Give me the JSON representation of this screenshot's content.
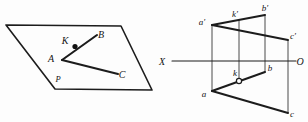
{
  "figure": {
    "background_color": "#fdfdfd",
    "ink_color": "#1c1c1c"
  },
  "left_diagram": {
    "name": "pictorial-plane-with-angle",
    "plane_label": "P",
    "points": [
      {
        "id": "A",
        "label": "A",
        "x": 62,
        "y": 60,
        "label_x": 51,
        "label_y": 62
      },
      {
        "id": "K",
        "label": "K",
        "x": 75,
        "y": 46,
        "label_x": 64,
        "label_y": 44
      },
      {
        "id": "B",
        "label": "B",
        "x": 97,
        "y": 35,
        "label_x": 99,
        "label_y": 38
      },
      {
        "id": "C",
        "label": "C",
        "x": 118,
        "y": 74,
        "label_x": 120,
        "label_y": 77
      }
    ],
    "plane_corners": [
      {
        "x": 6,
        "y": 25
      },
      {
        "x": 121,
        "y": 26
      },
      {
        "x": 152,
        "y": 90
      },
      {
        "x": 55,
        "y": 89
      }
    ],
    "segments": [
      {
        "from": "A",
        "to": "B",
        "through": "K"
      },
      {
        "from": "A",
        "to": "C"
      }
    ],
    "plane_label_pos": {
      "x": 58,
      "y": 81
    },
    "marked_point": "K"
  },
  "right_diagram": {
    "name": "orthographic-projection-epure",
    "axis": {
      "label_left": "X",
      "label_right": "O",
      "label_left_pos": {
        "x": 162,
        "y": 65
      },
      "label_right_pos": {
        "x": 298,
        "y": 65
      },
      "y": 61,
      "x_start": 172,
      "x_end": 296
    },
    "upper_points": [
      {
        "id": "a-prime",
        "label": "a′",
        "x": 212,
        "y": 25,
        "label_x": 201,
        "label_y": 24
      },
      {
        "id": "k-prime",
        "label": "k′",
        "x": 239,
        "y": 20,
        "label_x": 233,
        "label_y": 17
      },
      {
        "id": "b-prime",
        "label": "b′",
        "x": 265,
        "y": 15,
        "label_x": 262,
        "label_y": 13
      },
      {
        "id": "c-prime",
        "label": "c′",
        "x": 288,
        "y": 40,
        "label_x": 289,
        "label_y": 38
      }
    ],
    "lower_points": [
      {
        "id": "a",
        "label": "a",
        "x": 212,
        "y": 91,
        "label_x": 203,
        "label_y": 96
      },
      {
        "id": "k",
        "label": "k",
        "x": 239,
        "y": 79,
        "label_x": 234,
        "label_y": 74
      },
      {
        "id": "b",
        "label": "b",
        "x": 265,
        "y": 72,
        "label_x": 267,
        "label_y": 72
      },
      {
        "id": "c",
        "label": "c",
        "x": 288,
        "y": 113,
        "label_x": 289,
        "label_y": 115
      }
    ],
    "recall_lines": [
      {
        "id": "recall-a",
        "x": 212,
        "y_top": 25,
        "y_bottom": 91
      },
      {
        "id": "recall-k",
        "x": 239,
        "y_top": 20,
        "y_bottom": 79
      },
      {
        "id": "recall-b",
        "x": 265,
        "y_top": 15,
        "y_bottom": 72
      },
      {
        "id": "recall-c",
        "x": 288,
        "y_top": 40,
        "y_bottom": 113
      }
    ],
    "upper_segments": [
      {
        "from": "a-prime",
        "to": "b-prime"
      },
      {
        "from": "a-prime",
        "to": "c-prime"
      }
    ],
    "lower_segments": [
      {
        "from": "a",
        "to": "b"
      },
      {
        "from": "a",
        "to": "c"
      }
    ],
    "ring_marker": {
      "id": "k-ring",
      "x": 239,
      "y": 81,
      "r": 2.6
    }
  }
}
